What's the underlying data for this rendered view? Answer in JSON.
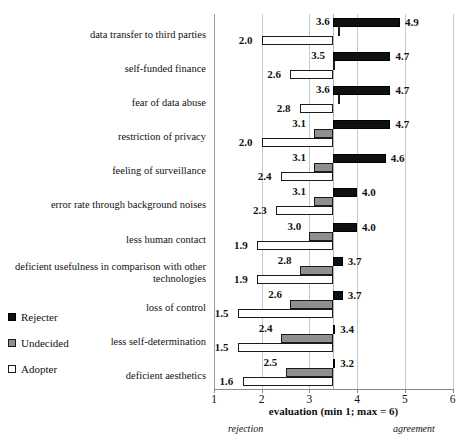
{
  "chart_data": {
    "type": "bar",
    "orientation": "horizontal",
    "title": "",
    "xlabel": "evaluation (min  1; max = 6)",
    "ylabel": "",
    "xlim": [
      1,
      6
    ],
    "xticks": [
      "1",
      "2",
      "3",
      "4",
      "5",
      "6"
    ],
    "grid": true,
    "pivot": 3.5,
    "legend_position": "left-bottom",
    "axis_pole_low": "rejection",
    "axis_pole_high": "agreement",
    "categories": [
      "data transfer to third parties",
      "self-funded finance",
      "fear of data abuse",
      "restriction of privacy",
      "feeling of surveillance",
      "error rate through background noises",
      "less human contact",
      "deficient usefulness in comparison with other technologies",
      "loss of control",
      "less self-determination",
      "deficient aesthetics"
    ],
    "series": [
      {
        "name": "Rejecter",
        "color": "#101010",
        "values": [
          4.9,
          4.7,
          4.7,
          4.7,
          4.6,
          4.0,
          4.0,
          3.7,
          3.7,
          3.4,
          3.2
        ],
        "labels": [
          "4.9",
          "4.7",
          "4.7",
          "4.7",
          "4.6",
          "4.0",
          "4.0",
          "3.7",
          "3.7",
          "3.4",
          "3.2"
        ]
      },
      {
        "name": "Undecided",
        "color": "#8f8f8f",
        "values": [
          3.6,
          3.5,
          3.6,
          3.1,
          3.1,
          3.1,
          3.0,
          2.8,
          2.6,
          2.4,
          2.5
        ],
        "labels": [
          "3.6",
          "3.5",
          "3.6",
          "3.1",
          "3.1",
          "3.1",
          "3.0",
          "2.8",
          "2.6",
          "2.4",
          "2.5"
        ]
      },
      {
        "name": "Adopter",
        "color": "#ffffff",
        "values": [
          2.0,
          2.6,
          2.8,
          2.0,
          2.4,
          2.3,
          1.9,
          1.9,
          1.5,
          1.5,
          1.6
        ],
        "labels": [
          "2.0",
          "2.6",
          "2.8",
          "2.0",
          "2.4",
          "2.3",
          "1.9",
          "1.9",
          "1.5",
          "1.5",
          "1.6"
        ]
      }
    ]
  },
  "legend": {
    "items": [
      {
        "label": "Rejecter",
        "swatch": "rejecter"
      },
      {
        "label": "Undecided",
        "swatch": "undecided"
      },
      {
        "label": "Adopter",
        "swatch": "adopter"
      }
    ]
  }
}
